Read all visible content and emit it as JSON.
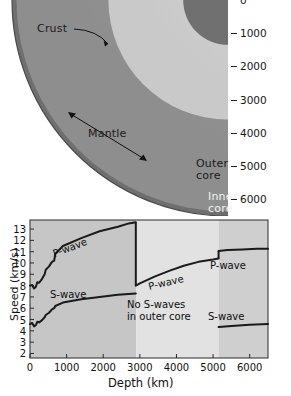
{
  "earth_diagram": {
    "labels": {
      "crust": "Crust",
      "mantle": "Mantle",
      "outer_core_line1": "Outer",
      "outer_core_line2": "core",
      "inner_core_line1": "Inner",
      "inner_core_line2": "core"
    },
    "depth_axis": {
      "title": "Depth (km)",
      "ticks": [
        "0",
        "1000",
        "2000",
        "3000",
        "4000",
        "5000",
        "6000"
      ],
      "values": [
        0,
        1000,
        2000,
        3000,
        4000,
        5000,
        6000
      ],
      "max": 6500
    },
    "layers": [
      {
        "name": "crust",
        "outer_depth_km": 100,
        "color": "#6f6f6f"
      },
      {
        "name": "mantle",
        "outer_depth_km": 2900,
        "color": "#9a9a9a"
      },
      {
        "name": "outer_core",
        "outer_depth_km": 5150,
        "color": "#d2d2d2"
      },
      {
        "name": "inner_core",
        "outer_depth_km": 6371,
        "color": "#707070"
      }
    ]
  },
  "chart_data": {
    "type": "line",
    "title": "",
    "xlabel": "Depth (km)",
    "ylabel": "Speed (km/s)",
    "xlim": [
      0,
      6500
    ],
    "ylim": [
      1.6,
      13.8
    ],
    "xticks": [
      0,
      1000,
      2000,
      3000,
      4000,
      5000,
      6000
    ],
    "xtick_labels": [
      "0",
      "1000",
      "2000",
      "3000",
      "4000",
      "5000",
      "6000"
    ],
    "yticks": [
      2,
      3,
      4,
      5,
      6,
      7,
      8,
      9,
      10,
      11,
      12,
      13
    ],
    "ytick_labels": [
      "2",
      "3",
      "4",
      "5",
      "6",
      "7",
      "8",
      "9",
      "10",
      "11",
      "12",
      "13"
    ],
    "grid": false,
    "legend": "none",
    "bands": [
      {
        "name": "mantle",
        "from_km": 0,
        "to_km": 2900,
        "color": "#c6c6c6"
      },
      {
        "name": "outer core",
        "from_km": 2900,
        "to_km": 5150,
        "color": "#e2e2e2"
      },
      {
        "name": "inner core",
        "from_km": 5150,
        "to_km": 6500,
        "color": "#cfcfcf"
      }
    ],
    "annotations": [
      {
        "text": "P-wave",
        "region": "mantle"
      },
      {
        "text": "P-wave",
        "region": "outer core"
      },
      {
        "text": "P-wave",
        "region": "inner core"
      },
      {
        "text": "S-wave",
        "region": "mantle"
      },
      {
        "text": "S-wave",
        "region": "inner core"
      },
      {
        "text": "No S-waves",
        "region": "outer core note line 1"
      },
      {
        "text": "in outer core",
        "region": "outer core note line 2"
      }
    ],
    "series": [
      {
        "name": "P-wave",
        "segment": "mantle",
        "x": [
          0,
          60,
          110,
          160,
          200,
          250,
          330,
          400,
          430,
          520,
          600,
          660,
          690,
          900,
          1400,
          1900,
          2400,
          2700,
          2890
        ],
        "y": [
          8.0,
          8.05,
          7.75,
          7.9,
          8.3,
          8.25,
          8.6,
          9.0,
          9.4,
          9.7,
          10.1,
          10.2,
          10.8,
          11.5,
          12.2,
          12.8,
          13.2,
          13.5,
          13.6
        ]
      },
      {
        "name": "P-wave",
        "segment": "outer core",
        "x": [
          2890,
          3000,
          3400,
          3800,
          4200,
          4600,
          5000,
          5150
        ],
        "y": [
          8.0,
          8.2,
          8.8,
          9.3,
          9.75,
          10.1,
          10.3,
          10.4
        ]
      },
      {
        "name": "P-wave",
        "segment": "inner core",
        "x": [
          5150,
          5400,
          5800,
          6200,
          6500
        ],
        "y": [
          11.05,
          11.15,
          11.2,
          11.25,
          11.25
        ]
      },
      {
        "name": "S-wave",
        "segment": "mantle",
        "x": [
          0,
          60,
          110,
          160,
          200,
          250,
          330,
          400,
          430,
          520,
          600,
          660,
          690,
          900,
          1400,
          1900,
          2400,
          2890
        ],
        "y": [
          4.6,
          4.7,
          4.4,
          4.5,
          4.8,
          4.75,
          4.95,
          5.2,
          5.4,
          5.6,
          5.9,
          6.0,
          6.2,
          6.5,
          6.8,
          7.0,
          7.2,
          7.3
        ]
      },
      {
        "name": "S-wave",
        "segment": "inner core",
        "x": [
          5150,
          5600,
          6000,
          6500
        ],
        "y": [
          4.35,
          4.45,
          4.55,
          4.6
        ]
      }
    ]
  }
}
